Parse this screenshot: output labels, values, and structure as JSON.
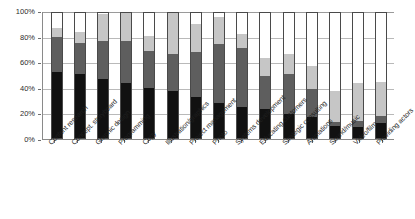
{
  "chart_data": {
    "type": "bar",
    "subtype": "stacked-percent",
    "title": "",
    "subtitle": "",
    "xlabel": "",
    "ylabel": "",
    "ylim": [
      0,
      100
    ],
    "yticks": [
      "0%",
      "20%",
      "40%",
      "60%",
      "80%",
      "100%"
    ],
    "ytick_values": [
      0,
      20,
      40,
      60,
      80,
      100
    ],
    "grid": true,
    "legend": "none",
    "legend_entries": [],
    "categories": [
      "Content research",
      "Concept. storyboard",
      "Graphic design",
      "Programming",
      "Copy",
      "Illustration/graphics",
      "Project management",
      "Photo",
      "Systems development",
      "Educating customers",
      "Strategic consulting",
      "Animations",
      "Sound/music",
      "Video/film",
      "Providing actors"
    ],
    "series": [
      {
        "name": "black",
        "color": "#111111",
        "values": [
          53,
          51,
          47,
          44,
          40,
          38,
          33,
          28,
          25,
          23,
          19,
          17,
          10,
          9,
          12
        ]
      },
      {
        "name": "dark-gray",
        "color": "#5e5e5e",
        "values": [
          28,
          25,
          31,
          34,
          30,
          29,
          36,
          47,
          47,
          27,
          32,
          22,
          3,
          5,
          6
        ]
      },
      {
        "name": "light-gray",
        "color": "#c6c6c6",
        "values": [
          7,
          9,
          21,
          22,
          12,
          33,
          22,
          22,
          11,
          14,
          16,
          19,
          25,
          30,
          27
        ]
      },
      {
        "name": "white",
        "color": "#ffffff",
        "values": [
          12,
          15,
          1,
          0,
          18,
          0,
          9,
          3,
          17,
          36,
          33,
          42,
          62,
          56,
          55
        ]
      }
    ],
    "axis_color": "#8a8a8a",
    "grid_color": "#b9b9b9",
    "bar_border_color": "#4a4a4a"
  }
}
